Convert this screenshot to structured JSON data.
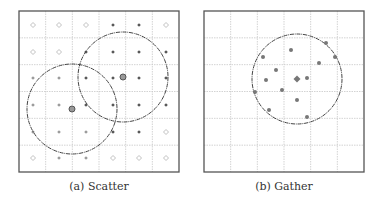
{
  "panels": [
    {
      "id": "scatter",
      "caption": "(a) Scatter",
      "frame": {
        "x": 19,
        "y": 11,
        "w": 160,
        "h": 161
      },
      "grid": {
        "cols": 6,
        "rows": 6
      },
      "point_x": [
        33,
        59,
        86,
        113,
        139,
        166
      ],
      "point_y": [
        25,
        52,
        78,
        105,
        132,
        158
      ],
      "point_types": [
        [
          "hollow",
          "hollow",
          "hollow",
          "dark",
          "dark",
          "hollow"
        ],
        [
          "hollow",
          "hollow",
          "dark",
          "dark",
          "dark",
          "dark"
        ],
        [
          "light",
          "light",
          "dark",
          "dark",
          "dark",
          "dark"
        ],
        [
          "light",
          "light",
          "dark",
          "dark",
          "dark",
          "dark"
        ],
        [
          "light",
          "light",
          "light",
          "dark",
          "dark",
          "hollow"
        ],
        [
          "hollow",
          "light",
          "light",
          "hollow",
          "hollow",
          "hollow"
        ]
      ],
      "circles": [
        {
          "cx": 72,
          "cy": 109,
          "r": 45
        },
        {
          "cx": 123,
          "cy": 77,
          "r": 45
        }
      ],
      "sources": [
        {
          "x": 72,
          "y": 109
        },
        {
          "x": 123,
          "y": 77
        }
      ]
    },
    {
      "id": "gather",
      "caption": "(b) Gather",
      "frame": {
        "x": 204,
        "y": 11,
        "w": 160,
        "h": 161
      },
      "grid": {
        "cols": 6,
        "rows": 6
      },
      "circle": {
        "cx": 297,
        "cy": 79,
        "r": 45
      },
      "center": {
        "x": 297,
        "y": 79
      },
      "points": [
        [
          326,
          43
        ],
        [
          335,
          57
        ],
        [
          263,
          57
        ],
        [
          291,
          50
        ],
        [
          319,
          63
        ],
        [
          276,
          70
        ],
        [
          266,
          80
        ],
        [
          307,
          78
        ],
        [
          255,
          92
        ],
        [
          282,
          90
        ],
        [
          297,
          100
        ],
        [
          269,
          110
        ],
        [
          307,
          117
        ]
      ]
    }
  ],
  "colors": {
    "frame": "#555555",
    "grid": "#c8c8c8",
    "circle": "#444444",
    "dark_point": "#555555",
    "light_point": "#9a9a9a",
    "hollow_point": "#b0b0b0",
    "gather_point": "#777777",
    "source_fill": "#999999",
    "source_stroke": "#555555"
  }
}
